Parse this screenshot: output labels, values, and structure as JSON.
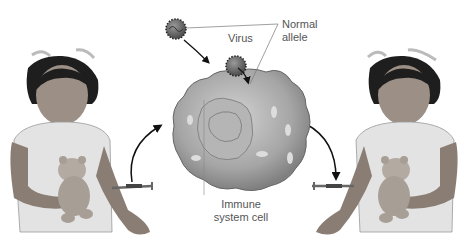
{
  "diagram": {
    "labels": {
      "virus": "Virus",
      "normal_allele_line1": "Normal",
      "normal_allele_line2": "allele",
      "immune_cell_line1": "Immune",
      "immune_cell_line2": "system cell"
    },
    "figures": {
      "left_child": "child-with-teddy-bear-receiving-injection",
      "right_child": "child-with-teddy-bear-receiving-injection",
      "center": "immune-system-cell-with-virus"
    },
    "colors": {
      "background": "#ffffff",
      "text": "#555555",
      "cell_fill": "#a9a9a9",
      "virus_fill": "#6e6e6e",
      "arrow": "#111111"
    }
  }
}
